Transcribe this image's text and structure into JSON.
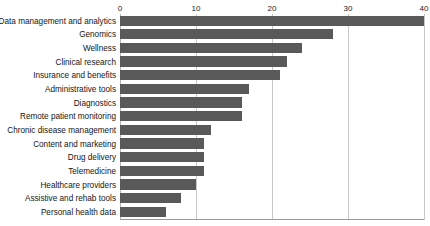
{
  "chart_data": {
    "type": "bar",
    "orientation": "horizontal",
    "title": "",
    "xlabel": "",
    "ylabel": "",
    "xlim": [
      0,
      40
    ],
    "ylim": null,
    "grid": true,
    "legend": null,
    "bar_color": "#595959",
    "gridline_color": "#c8c8c8",
    "xticks": [
      0,
      10,
      20,
      30,
      40
    ],
    "xtick_labels": [
      "0",
      "10",
      "20",
      "30",
      "40"
    ],
    "categories": [
      "Data management and analytics",
      "Genomics",
      "Wellness",
      "Clinical research",
      "Insurance and benefits",
      "Administrative tools",
      "Diagnostics",
      "Remote patient monitoring",
      "Chronic disease management",
      "Content and marketing",
      "Drug delivery",
      "Telemedicine",
      "Healthcare providers",
      "Assistive and rehab tools",
      "Personal health data"
    ],
    "values": [
      40,
      28,
      24,
      22,
      21,
      17,
      16,
      16,
      12,
      11,
      11,
      11,
      10,
      8,
      6
    ]
  }
}
